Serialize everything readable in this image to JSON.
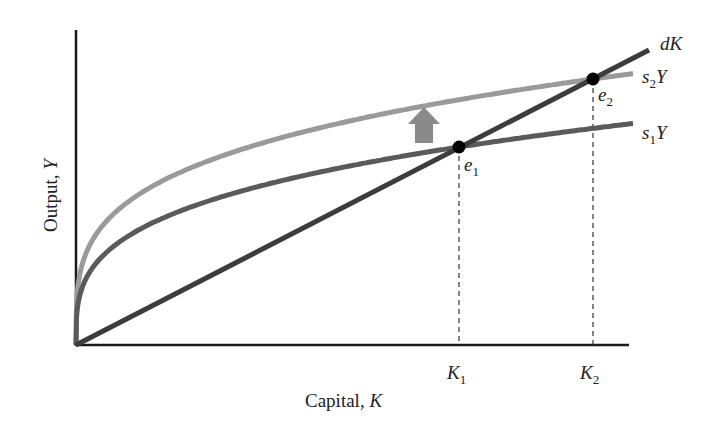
{
  "diagram": {
    "x_axis": {
      "label": "Capital, ",
      "label_var": "K"
    },
    "y_axis": {
      "label": "Output, ",
      "label_var": "Y"
    },
    "curves": [
      {
        "id": "dK",
        "label": "dK",
        "label_main": "dK",
        "label_sub": "",
        "type": "line",
        "color": "#3c3c3c"
      },
      {
        "id": "s2Y",
        "label": "s2Y",
        "label_pre": "s",
        "label_sub": "2",
        "label_post": "Y",
        "type": "concave",
        "color": "#9a9a9a"
      },
      {
        "id": "s1Y",
        "label": "s1Y",
        "label_pre": "s",
        "label_sub": "1",
        "label_post": "Y",
        "type": "concave",
        "color": "#5a5a5a"
      }
    ],
    "equilibria": [
      {
        "id": "e1",
        "label_main": "e",
        "label_sub": "1",
        "on": [
          "s1Y",
          "dK"
        ]
      },
      {
        "id": "e2",
        "label_main": "e",
        "label_sub": "2",
        "on": [
          "s2Y",
          "dK"
        ]
      }
    ],
    "ticks": [
      {
        "id": "K1",
        "label_main": "K",
        "label_sub": "1"
      },
      {
        "id": "K2",
        "label_main": "K",
        "label_sub": "2"
      }
    ],
    "annotation": {
      "type": "up-arrow",
      "meaning": "shift from s1Y to s2Y",
      "color": "#8a8a8a"
    }
  }
}
